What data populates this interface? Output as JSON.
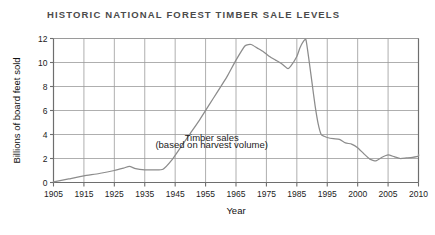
{
  "chart_data": {
    "type": "line",
    "title": "HISTORIC NATIONAL FOREST TIMBER SALE LEVELS",
    "xlabel": "Year",
    "ylabel": "Billions of board feet sold",
    "xlim": [
      1905,
      2011
    ],
    "ylim": [
      0,
      12
    ],
    "grid": true,
    "legend": "none",
    "line_color": "#8c8c8c",
    "grid_color": "#9a9a9a",
    "axis_color": "#6e6e6e",
    "title_color": "#4b4b4b",
    "xticks": [
      "1905",
      "1915",
      "1925",
      "1935",
      "1945",
      "1955",
      "1965",
      "1975",
      "1985",
      "1995",
      "2000",
      "2005",
      "2010"
    ],
    "xtick_values": [
      1905,
      1915,
      1925,
      1935,
      1945,
      1955,
      1965,
      1975,
      1985,
      1995,
      2000,
      2005,
      2010
    ],
    "yticks": [
      "0",
      "2",
      "4",
      "6",
      "8",
      "10",
      "12"
    ],
    "ytick_values": [
      0,
      2,
      4,
      6,
      8,
      10,
      12
    ],
    "annotations": [
      {
        "text": "Timber sales",
        "x": 1957,
        "y": 3.5
      },
      {
        "text": "(based on harvest volume)",
        "x": 1957,
        "y": 2.85
      }
    ],
    "series": [
      {
        "name": "Timber sales (based on harvest volume)",
        "x": [
          1905,
          1910,
          1915,
          1920,
          1925,
          1928,
          1930,
          1932,
          1935,
          1938,
          1941,
          1944,
          1947,
          1950,
          1953,
          1956,
          1959,
          1962,
          1965,
          1968,
          1970,
          1972,
          1974,
          1976,
          1978,
          1980,
          1982,
          1983,
          1985,
          1986,
          1987,
          1988,
          1989,
          1990,
          1991,
          1992,
          1993,
          1994,
          1995,
          1996,
          1997,
          1998,
          1999,
          2000,
          2001,
          2002,
          2003,
          2004,
          2005,
          2006,
          2007,
          2008,
          2009,
          2010,
          2011
        ],
        "y": [
          0.05,
          0.3,
          0.55,
          0.75,
          1.0,
          1.2,
          1.35,
          1.15,
          1.05,
          1.05,
          1.1,
          1.9,
          3.0,
          4.1,
          5.2,
          6.4,
          7.6,
          8.8,
          10.2,
          11.4,
          11.5,
          11.2,
          10.9,
          10.5,
          10.2,
          9.9,
          9.5,
          9.7,
          10.5,
          11.2,
          11.7,
          11.9,
          10.2,
          8.3,
          6.4,
          4.9,
          4.0,
          3.85,
          3.75,
          3.65,
          3.6,
          3.3,
          3.2,
          2.9,
          2.4,
          1.95,
          1.8,
          2.1,
          2.3,
          2.15,
          2.0,
          2.05,
          2.1,
          2.2,
          2.35
        ]
      }
    ]
  }
}
